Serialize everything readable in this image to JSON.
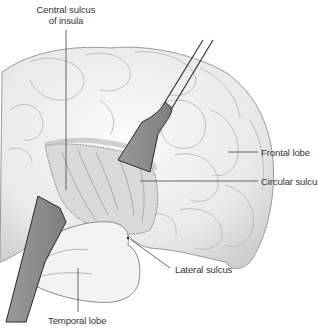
{
  "figure": {
    "labels": {
      "central_sulcus_line1": "Central sulcus",
      "central_sulcus_line2": "of insula",
      "frontal_lobe": "Frontal lobe",
      "circular_sulcus": "Circular sulcus",
      "lateral_sulcus": "Lateral sulcus",
      "temporal_lobe": "Temporal lobe"
    },
    "colors": {
      "background": "#ffffff",
      "brain_fill": "#ececec",
      "brain_outline": "#9a9a9a",
      "insula_fill": "#dcdcdc",
      "retractor_fill": "#8e8e8e",
      "retractor_outline": "#2a2a2a",
      "leader_line": "#444444",
      "label_text": "#333333"
    }
  }
}
